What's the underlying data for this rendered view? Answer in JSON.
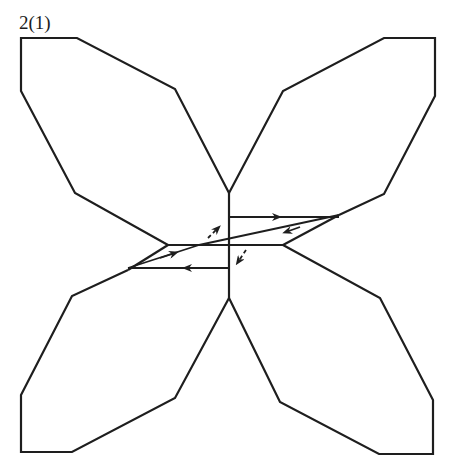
{
  "figure": {
    "label": "2(1)",
    "stroke_color": "#1e1e1e",
    "lobes": [
      {
        "name": "top-left",
        "points": "229,193 175,89 77,38 21,38 21,91 75,193 168,245"
      },
      {
        "name": "top-right",
        "points": "229,193 283,91 384,38 435,38 435,96 384,194 339,215"
      },
      {
        "name": "bottom-left",
        "points": "229,298 175,398 72,452 21,452 21,395 72,296 128,270"
      },
      {
        "name": "bottom-right",
        "points": "229,298 280,402 379,454 433,454 433,400 380,298 283,245"
      }
    ],
    "center_line": {
      "x": 229,
      "y1": 193,
      "y2": 298
    },
    "horizontal_line": {
      "y": 245,
      "x1": 168,
      "x2": 283
    }
  }
}
